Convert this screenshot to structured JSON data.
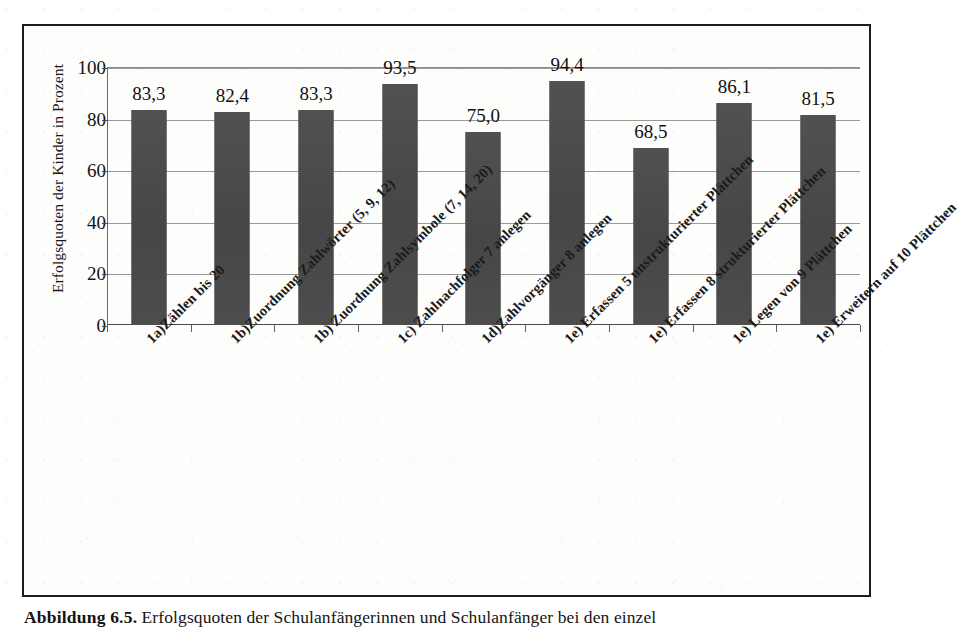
{
  "figure": {
    "caption_label": "Abbildung 6.5.",
    "caption_text": "Erfolgsquoten der Schulanfängerinnen und Schulanfänger bei den einzel"
  },
  "chart_data": {
    "type": "bar",
    "title": "",
    "xlabel": "",
    "ylabel": "Erfolgsquoten der Kinder in Prozent",
    "ylim": [
      0,
      100
    ],
    "yticks": [
      0,
      20,
      40,
      60,
      80,
      100
    ],
    "grid": true,
    "legend": "none",
    "bar_color": "#4b4b4b",
    "categories": [
      "1a)Zählen bis 20",
      "1b)Zuordnung Zahlwörter (5, 9, 12)",
      "1b) Zuordnung Zahlsymbole (7, 14, 20)",
      "1c) Zahlnachfolger 7 anlegen",
      "1d)Zahlvorgänger 8 anlegen",
      "1e) Erfassen 5 unstrukturierter Plättchen",
      "1e) Erfassen 8 strukturierter Plättchen",
      "1e) Legen  von 9 Plättchen",
      "1e) Erweitern auf 10 Plättchen"
    ],
    "values": [
      83.3,
      82.4,
      83.3,
      93.5,
      75.0,
      94.4,
      68.5,
      86.1,
      81.5
    ],
    "value_labels": [
      "83,3",
      "82,4",
      "83,3",
      "93,5",
      "75,0",
      "94,4",
      "68,5",
      "86,1",
      "81,5"
    ]
  }
}
